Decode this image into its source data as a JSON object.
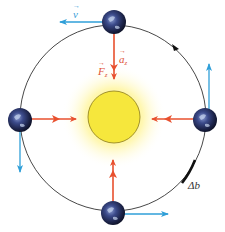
{
  "diagram": {
    "type": "orbit-centripetal-force",
    "orbit": {
      "cx": 113,
      "cy": 118,
      "r": 93,
      "color": "#333333"
    },
    "sun": {
      "cx": 114,
      "cy": 117,
      "r": 26,
      "fill": "#f6e73c",
      "stroke": "#8a7a1a",
      "glow": "#fff6a0"
    },
    "planets": [
      {
        "id": "top",
        "cx": 114,
        "cy": 22
      },
      {
        "id": "left",
        "cx": 20,
        "cy": 120
      },
      {
        "id": "right",
        "cx": 205,
        "cy": 120
      },
      {
        "id": "bottom",
        "cx": 113,
        "cy": 213
      }
    ],
    "colors": {
      "force": "#e8502e",
      "velocity": "#2f9fd8",
      "arc_highlight": "#111111"
    },
    "labels": {
      "velocity": "v",
      "acceleration": "a",
      "acceleration_sub": "z",
      "force": "F",
      "force_sub": "z",
      "arc_length": "Δb"
    }
  }
}
